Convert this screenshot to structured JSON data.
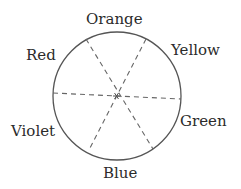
{
  "diagram": {
    "type": "color-wheel",
    "circle": {
      "cx": 117,
      "cy": 96,
      "r": 64,
      "stroke": "#555555"
    },
    "center_marker": "asterisk",
    "labels": {
      "orange": "Orange",
      "yellow": "Yellow",
      "green": "Green",
      "blue": "Blue",
      "violet": "Violet",
      "red": "Red"
    },
    "diameters": [
      {
        "name": "red-green",
        "from": "between Red and Violet",
        "to": "between Yellow and Green"
      },
      {
        "name": "orange-blue-left",
        "from": "between Red and Orange",
        "to": "between Blue and Green"
      },
      {
        "name": "orange-blue-right",
        "from": "between Orange and Yellow",
        "to": "between Violet and Blue"
      }
    ]
  }
}
